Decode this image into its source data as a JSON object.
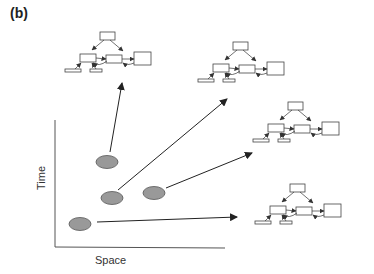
{
  "figure": {
    "panel_label": "(b)",
    "axes": {
      "x_label": "Space",
      "y_label": "Time"
    },
    "colors": {
      "ellipse_fill": "#999999",
      "ellipse_stroke": "#555555",
      "line": "#222222",
      "box_stroke": "#444444"
    },
    "nodes": [
      {
        "id": "sample-1",
        "cx": 107,
        "cy": 162
      },
      {
        "id": "sample-2",
        "cx": 112,
        "cy": 198
      },
      {
        "id": "sample-3",
        "cx": 154,
        "cy": 193
      },
      {
        "id": "sample-4",
        "cx": 80,
        "cy": 224
      }
    ],
    "arrows": [
      {
        "from": "sample-1",
        "x1": 110,
        "y1": 152,
        "x2": 122,
        "y2": 83
      },
      {
        "from": "sample-2",
        "x1": 118,
        "y1": 190,
        "x2": 227,
        "y2": 99
      },
      {
        "from": "sample-3",
        "x1": 166,
        "y1": 188,
        "x2": 252,
        "y2": 153
      },
      {
        "from": "sample-4",
        "x1": 97,
        "y1": 222,
        "x2": 237,
        "y2": 217
      }
    ],
    "networks": [
      {
        "id": "network-1",
        "x": 63,
        "y": 30
      },
      {
        "id": "network-2",
        "x": 196,
        "y": 40
      },
      {
        "id": "network-3",
        "x": 251,
        "y": 100
      },
      {
        "id": "network-4",
        "x": 253,
        "y": 182
      }
    ]
  }
}
